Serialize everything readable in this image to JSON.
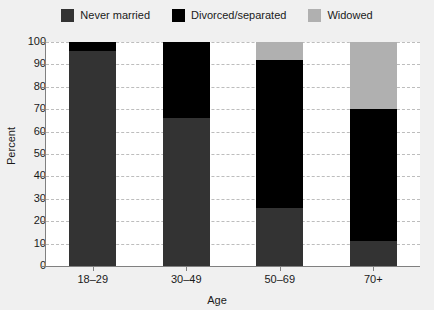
{
  "chart_data": {
    "type": "bar",
    "subtype": "stacked-bar",
    "title": "",
    "xlabel": "Age",
    "ylabel": "Percent",
    "categories": [
      "18–29",
      "30–49",
      "50–69",
      "70+"
    ],
    "series": [
      {
        "name": "Never married",
        "color": "#333333",
        "values": [
          96,
          66,
          26,
          11
        ]
      },
      {
        "name": "Divorced/separated",
        "color": "#000000",
        "values": [
          4,
          34,
          66,
          59
        ]
      },
      {
        "name": "Widowed",
        "color": "#b0b0b0",
        "values": [
          0,
          0,
          8,
          30
        ]
      }
    ],
    "ylim": [
      0,
      100
    ],
    "ytick_values": [
      0,
      10,
      20,
      30,
      40,
      50,
      60,
      70,
      80,
      90,
      100
    ],
    "ytick_labels": [
      "0",
      "10",
      "20",
      "30",
      "40",
      "50",
      "60",
      "70",
      "80",
      "90",
      "100"
    ],
    "grid": true,
    "grid_style": "dashed-horizontal",
    "legend_position": "top-center",
    "background_color": "#f0f0f0",
    "plot_background_color": "#ffffff",
    "axis_color": "#808080",
    "gridline_color": "#bdbdbd"
  }
}
